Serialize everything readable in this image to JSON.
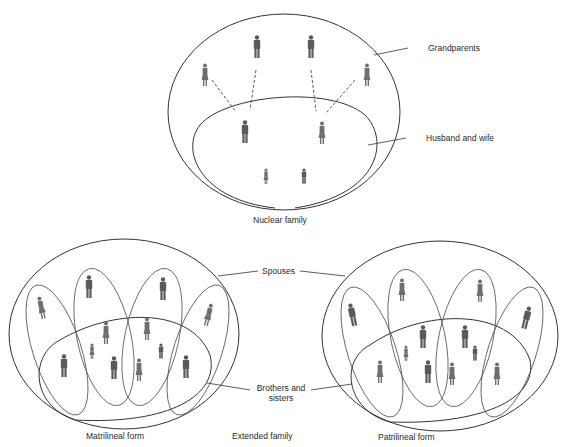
{
  "nuclear": {
    "labels": {
      "grandparents": "Grandparents",
      "husband_and_wife": "Husband and wife",
      "caption": "Nuclear family"
    },
    "members": [
      {
        "role": "grandmother",
        "sex": "female",
        "x": 205,
        "y": 65
      },
      {
        "role": "grandfather",
        "sex": "male",
        "x": 257,
        "y": 37
      },
      {
        "role": "grandfather",
        "sex": "male",
        "x": 311,
        "y": 37
      },
      {
        "role": "grandmother",
        "sex": "female",
        "x": 367,
        "y": 65
      },
      {
        "role": "husband",
        "sex": "male",
        "x": 245,
        "y": 120
      },
      {
        "role": "wife",
        "sex": "female",
        "x": 322,
        "y": 122
      },
      {
        "role": "child",
        "sex": "female",
        "x": 266,
        "y": 167
      },
      {
        "role": "child",
        "sex": "male",
        "x": 304,
        "y": 167
      }
    ]
  },
  "extended": {
    "caption": "Extended family",
    "labels": {
      "spouses": "Spouses",
      "brothers_and_sisters_line1": "Brothers and",
      "brothers_and_sisters_line2": "sisters"
    },
    "matrilineal": {
      "caption": "Matrilineal form",
      "spouses": [
        "male",
        "male",
        "male",
        "male"
      ],
      "siblings": [
        "female",
        "female",
        "female",
        "female"
      ]
    },
    "patrilineal": {
      "caption": "Patrilineal form",
      "spouses": [
        "female",
        "female",
        "female",
        "female"
      ],
      "siblings": [
        "male",
        "male",
        "male",
        "male"
      ]
    }
  }
}
